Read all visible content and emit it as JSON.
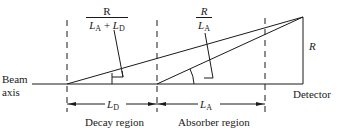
{
  "diagram": {
    "beam_axis_label": [
      "Beam",
      "axis"
    ],
    "detector_label": "Detector",
    "height_label": "R",
    "decay_region_label": "Decay region",
    "absorber_region_label": "Absorber region",
    "decay_length": {
      "symbol": "L",
      "subscript": "D"
    },
    "absorber_length": {
      "symbol": "L",
      "subscript": "A"
    },
    "angle_decay": {
      "numerator": "R",
      "denominator": {
        "a_symbol": "L",
        "a_sub": "A",
        "op": "+",
        "b_symbol": "L",
        "b_sub": "D"
      }
    },
    "angle_absorber": {
      "numerator": "R",
      "denominator": {
        "symbol": "L",
        "sub": "A"
      }
    },
    "colors": {
      "line": "#1a1a1a",
      "background": "#ffffff"
    }
  }
}
